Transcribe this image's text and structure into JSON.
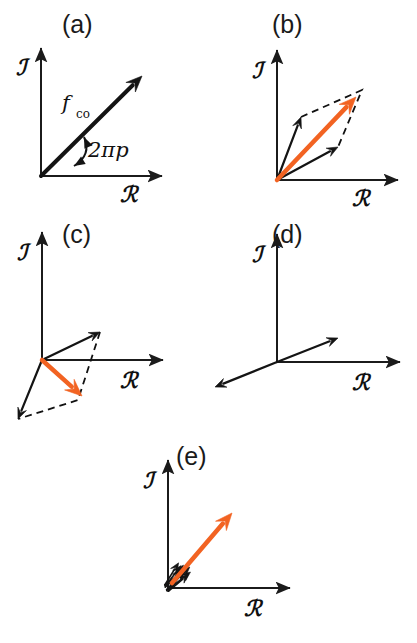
{
  "figure": {
    "background_color": "#ffffff",
    "width": 417,
    "height": 643,
    "orange_color": "#F26322",
    "black_color": "#141414",
    "axis_color": "#1b1b1b"
  },
  "axis_labels": {
    "real": "ℛ",
    "imaginary": "ℐ",
    "real_name": "real-axis-label",
    "imaginary_name": "imaginary-axis-label"
  },
  "panels": [
    {
      "id": "a",
      "label": "(a)",
      "label_x": 62,
      "label_y": 33,
      "origin": [
        41,
        176
      ],
      "x_axis_end": [
        162,
        176
      ],
      "y_axis_end": [
        41,
        48
      ],
      "x_label_pos": [
        120,
        202
      ],
      "y_label_pos": [
        16,
        75
      ],
      "caption_note": "single coherent phasor f_co at angle 2 pi p",
      "vector_label": "f",
      "vector_label_sub": "co",
      "vector_label_pos": [
        62,
        110
      ],
      "vector_label_sub_pos": [
        76,
        118
      ],
      "angle_label": "2πp",
      "angle_label_pos": [
        88,
        157
      ],
      "black_vectors": [
        {
          "name": "f-co-vector",
          "from": [
            41,
            176
          ],
          "to": [
            142,
            76
          ],
          "width": 4,
          "head": 16
        }
      ],
      "orange_vectors": [],
      "dashed_paths": [],
      "angle_arc": {
        "from": [
          84,
          137
        ],
        "to": [
          74,
          166
        ],
        "cx": 92,
        "cy": 155
      }
    },
    {
      "id": "b",
      "label": "(b)",
      "label_x": 272,
      "label_y": 33,
      "origin": [
        277,
        180
      ],
      "x_axis_end": [
        398,
        180
      ],
      "y_axis_end": [
        277,
        50
      ],
      "x_label_pos": [
        352,
        206
      ],
      "y_label_pos": [
        252,
        78
      ],
      "caption_note": "two phasors with small phase spread add to a large resultant",
      "black_vectors": [
        {
          "name": "component-vector-1",
          "from": [
            277,
            180
          ],
          "to": [
            301,
            117
          ],
          "width": 2.2,
          "head": 11
        },
        {
          "name": "component-vector-2",
          "from": [
            277,
            180
          ],
          "to": [
            338,
            147
          ],
          "width": 2.2,
          "head": 11
        }
      ],
      "orange_vectors": [
        {
          "name": "resultant-vector",
          "from": [
            277,
            180
          ],
          "to": [
            356,
            97
          ],
          "width": 4.5,
          "head": 17
        }
      ],
      "dashed_paths": [
        {
          "name": "parallelogram-guide",
          "points": [
            [
              301,
              117
            ],
            [
              362,
              90
            ],
            [
              338,
              147
            ]
          ]
        }
      ]
    },
    {
      "id": "c",
      "label": "(c)",
      "label_x": 62,
      "label_y": 243,
      "origin": [
        42,
        360
      ],
      "x_axis_end": [
        163,
        360
      ],
      "y_axis_end": [
        42,
        232
      ],
      "x_label_pos": [
        120,
        388
      ],
      "y_label_pos": [
        17,
        260
      ],
      "caption_note": "two phasors with larger phase spread give a smaller resultant",
      "black_vectors": [
        {
          "name": "component-vector-1",
          "from": [
            42,
            360
          ],
          "to": [
            100,
            332
          ],
          "width": 2.2,
          "head": 11
        },
        {
          "name": "component-vector-2",
          "from": [
            42,
            360
          ],
          "to": [
            18,
            419
          ],
          "width": 2.2,
          "head": 11
        }
      ],
      "orange_vectors": [
        {
          "name": "resultant-vector",
          "from": [
            42,
            360
          ],
          "to": [
            82,
            396
          ],
          "width": 4.5,
          "head": 17
        }
      ],
      "dashed_paths": [
        {
          "name": "parallelogram-guide",
          "points": [
            [
              100,
              332
            ],
            [
              78,
              400
            ],
            [
              18,
              419
            ]
          ]
        }
      ]
    },
    {
      "id": "d",
      "label": "(d)",
      "label_x": 272,
      "label_y": 243,
      "origin": [
        277,
        362
      ],
      "x_axis_end": [
        400,
        362
      ],
      "y_axis_end": [
        277,
        234
      ],
      "x_label_pos": [
        352,
        390
      ],
      "y_label_pos": [
        252,
        262
      ],
      "caption_note": "antiparallel phasors cancel, no resultant",
      "black_vectors": [
        {
          "name": "component-vector-1",
          "from": [
            277,
            362
          ],
          "to": [
            338,
            338
          ],
          "width": 2.2,
          "head": 11
        },
        {
          "name": "component-vector-2",
          "from": [
            277,
            362
          ],
          "to": [
            215,
            387
          ],
          "width": 2.2,
          "head": 11
        }
      ],
      "orange_vectors": [],
      "dashed_paths": []
    },
    {
      "id": "e",
      "label": "(e)",
      "label_x": 176,
      "label_y": 465,
      "origin": [
        168,
        588
      ],
      "x_axis_end": [
        290,
        588
      ],
      "y_axis_end": [
        168,
        460
      ],
      "x_label_pos": [
        244,
        616
      ],
      "y_label_pos": [
        143,
        488
      ],
      "caption_note": "many small in-phase phasors sum to a long resultant",
      "black_vectors": [],
      "orange_vectors": [
        {
          "name": "resultant-vector",
          "from": [
            172,
            583
          ],
          "to": [
            232,
            513
          ],
          "width": 4.5,
          "head": 17
        }
      ],
      "dashed_paths": [],
      "tiny_vector_cluster": {
        "name": "small-phasor-cluster",
        "count": 14,
        "base": [
          168,
          588
        ],
        "length": 26,
        "base_angle_deg": -49,
        "spread_deg": 26,
        "jitter": 3.2
      }
    }
  ],
  "chart_data": {
    "type": "diagram",
    "xlabel": "ℛ (real part)",
    "ylabel": "ℐ (imaginary part)",
    "legend": [
      {
        "name": "individual-phasor",
        "label": "individual phasor (black)",
        "color": "#141414"
      },
      {
        "name": "resultant-phasor",
        "label": "resultant phasor (orange)",
        "color": "#F26322"
      },
      {
        "name": "construction-guide",
        "label": "parallelogram construction (dashed)",
        "color": "#111111"
      }
    ],
    "panels": [
      {
        "id": "a",
        "label": "(a)",
        "description": "single phasor f_co at phase angle 2 pi p",
        "vectors": [
          {
            "series": "f_co",
            "color": "#141414",
            "angle_deg": 44.7,
            "magnitude": 142
          }
        ]
      },
      {
        "id": "b",
        "label": "(b)",
        "description": "two nearly in-phase components and their orange resultant",
        "vectors": [
          {
            "series": "component 1",
            "color": "#141414",
            "angle_deg": 69.1,
            "magnitude": 67
          },
          {
            "series": "component 2",
            "color": "#141414",
            "angle_deg": 28.4,
            "magnitude": 69
          },
          {
            "series": "resultant",
            "color": "#F26322",
            "angle_deg": 46.4,
            "magnitude": 114
          }
        ]
      },
      {
        "id": "c",
        "label": "(c)",
        "description": "two widely separated components and their short orange resultant",
        "vectors": [
          {
            "series": "component 1",
            "color": "#141414",
            "angle_deg": 25.8,
            "magnitude": 64
          },
          {
            "series": "component 2",
            "color": "#141414",
            "angle_deg": 247.9,
            "magnitude": 64
          },
          {
            "series": "resultant",
            "color": "#F26322",
            "angle_deg": -42.0,
            "magnitude": 54
          }
        ]
      },
      {
        "id": "d",
        "label": "(d)",
        "description": "antiparallel components cancel exactly, resultant is zero",
        "vectors": [
          {
            "series": "component 1",
            "color": "#141414",
            "angle_deg": 21.5,
            "magnitude": 66
          },
          {
            "series": "component 2",
            "color": "#141414",
            "angle_deg": 201.5,
            "magnitude": 67
          }
        ]
      },
      {
        "id": "e",
        "label": "(e)",
        "description": "cluster of many short in-phase phasors summing to a long orange resultant",
        "vectors": [
          {
            "series": "small phasors (x14)",
            "color": "#141414",
            "angle_deg": 49.0,
            "magnitude": 26
          },
          {
            "series": "resultant",
            "color": "#F26322",
            "angle_deg": 49.4,
            "magnitude": 92
          }
        ]
      }
    ],
    "annotations": [
      {
        "name": "f-co-label",
        "text": "f_co",
        "panel": "a"
      },
      {
        "name": "phase-angle-label",
        "text": "2πp",
        "panel": "a"
      }
    ],
    "grid": false,
    "axis_arrows": true
  }
}
